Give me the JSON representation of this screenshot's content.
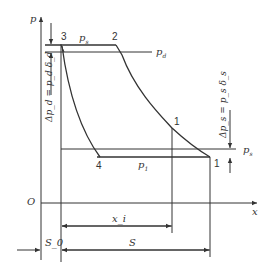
{
  "diagram": {
    "type": "p-x indicator diagram (compressor cycle)",
    "axes": {
      "y_label": "p",
      "x_label": "x",
      "origin_label": "O"
    },
    "points": [
      {
        "id": "3",
        "label": "3"
      },
      {
        "id": "2",
        "label": "2"
      },
      {
        "id": "4",
        "label": "4"
      },
      {
        "id": "1",
        "label": "1"
      },
      {
        "id": "1i",
        "label": "1"
      }
    ],
    "pressure_labels": {
      "top_line": "p",
      "top_line_sub": "s",
      "discharge": "p",
      "discharge_sub": "d",
      "suction_low": "p",
      "suction_low_sub": "1",
      "suction_right": "p",
      "suction_right_sub": "s"
    },
    "delta_labels": {
      "left": "Δp_d = p_d δ_d",
      "right": "Δp_s = p_s δ_s"
    },
    "dimensions": {
      "xi": "x_i",
      "S0": "S_0",
      "S": "S"
    },
    "colors": {
      "line": "#333333",
      "background": "#ffffff"
    }
  }
}
